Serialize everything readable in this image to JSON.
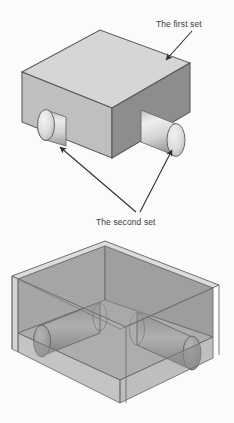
{
  "figure": {
    "background_color": "#fbfbfb",
    "ink_color": "#3b3b3b"
  },
  "labels": {
    "first_set": "The first set",
    "second_set": "The second set"
  },
  "colors": {
    "box_top_face": "#d6d6d6",
    "box_left_face": "#bfbfbf",
    "box_front_face": "#8d8d8d",
    "box_right_face": "#7e7e7e",
    "cylinder_light": "#e6e6e6",
    "cylinder_mid": "#c9c9c9",
    "cylinder_dark": "#9a9a9a",
    "outline": "#5a5a5a",
    "ghost_face": "#9a9a9a",
    "ghost_edge": "#6e6e6e",
    "arrow": "#2e2e2e"
  },
  "views": {
    "solid": {
      "name": "solid-block-view",
      "description": "Opaque isometric rectangular block with two cylinders protruding from the left and front faces"
    },
    "transparent": {
      "name": "transparent-block-view",
      "description": "Semi-transparent isometric block revealing two cylinders passing through its interior"
    }
  },
  "annotations": [
    {
      "id": "first-set",
      "text": "The first set",
      "target": "block-top-right-edge"
    },
    {
      "id": "second-set",
      "text": "The second set",
      "target": "both-cylinders"
    }
  ]
}
